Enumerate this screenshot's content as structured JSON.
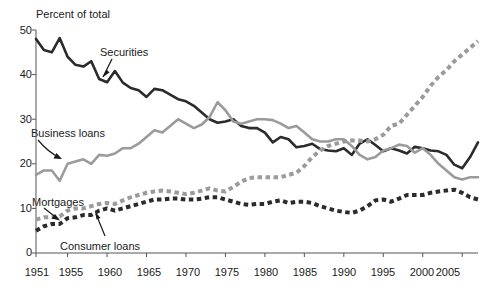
{
  "chart_data": {
    "type": "line",
    "title": "",
    "subtitle": "",
    "ylabel": "Percent of total",
    "xlabel": "",
    "ylim": [
      0,
      50
    ],
    "xlim": [
      1951,
      2007
    ],
    "grid": false,
    "legend_position": "inline-annotations",
    "y_ticks": [
      0,
      10,
      20,
      30,
      40,
      50
    ],
    "y_tick_labels": [
      "0",
      "10",
      "20",
      "30",
      "40",
      "50"
    ],
    "x_ticks": [
      1951,
      1955,
      1960,
      1965,
      1970,
      1975,
      1980,
      1985,
      1990,
      1995,
      2000,
      2005
    ],
    "x_tick_labels": [
      "1951",
      "1955",
      "1960",
      "1965",
      "1970",
      "1975",
      "1980",
      "1985",
      "1990",
      "1995",
      "2000",
      "2005"
    ],
    "x": [
      1951,
      1952,
      1953,
      1954,
      1955,
      1956,
      1957,
      1958,
      1959,
      1960,
      1961,
      1962,
      1963,
      1964,
      1965,
      1966,
      1967,
      1968,
      1969,
      1970,
      1971,
      1972,
      1973,
      1974,
      1975,
      1976,
      1977,
      1978,
      1979,
      1980,
      1981,
      1982,
      1983,
      1984,
      1985,
      1986,
      1987,
      1988,
      1989,
      1990,
      1991,
      1992,
      1993,
      1994,
      1995,
      1996,
      1997,
      1998,
      1999,
      2000,
      2001,
      2002,
      2003,
      2004,
      2005,
      2006,
      2007
    ],
    "series": [
      {
        "name": "Securities",
        "style": "solid",
        "color": "#2b2b2b",
        "values": [
          48.0,
          45.5,
          45.0,
          48.2,
          44.0,
          42.2,
          41.8,
          43.0,
          39.0,
          38.3,
          40.8,
          38.2,
          37.0,
          36.5,
          35.0,
          36.8,
          36.5,
          35.5,
          34.5,
          34.0,
          33.0,
          31.5,
          30.0,
          29.2,
          29.5,
          30.0,
          28.5,
          28.0,
          28.0,
          27.0,
          24.8,
          26.0,
          25.5,
          23.7,
          24.0,
          24.5,
          23.3,
          23.0,
          22.8,
          23.5,
          22.0,
          24.5,
          25.5,
          24.2,
          22.8,
          23.5,
          23.0,
          22.3,
          23.8,
          23.5,
          23.0,
          22.8,
          22.0,
          19.8,
          19.0,
          21.5,
          24.8
        ]
      },
      {
        "name": "Business loans",
        "style": "solid",
        "color": "#9b9b9b",
        "values": [
          17.5,
          18.5,
          18.5,
          16.2,
          20.0,
          20.5,
          21.0,
          20.0,
          22.0,
          21.8,
          22.3,
          23.5,
          23.5,
          24.5,
          26.0,
          27.5,
          27.0,
          28.5,
          30.0,
          29.0,
          28.0,
          28.8,
          30.5,
          33.8,
          32.0,
          29.5,
          29.0,
          29.5,
          30.0,
          30.0,
          29.8,
          29.0,
          28.0,
          28.5,
          27.0,
          25.5,
          25.0,
          25.0,
          25.5,
          25.5,
          24.0,
          22.0,
          21.0,
          21.5,
          23.0,
          23.5,
          24.3,
          24.0,
          22.5,
          23.5,
          22.0,
          20.0,
          18.5,
          17.0,
          16.5,
          17.0,
          17.0
        ]
      },
      {
        "name": "Mortgages",
        "style": "dashed",
        "color": "#9b9b9b",
        "values": [
          7.5,
          8.0,
          8.0,
          8.2,
          9.5,
          10.0,
          10.0,
          10.5,
          11.0,
          11.2,
          11.0,
          11.8,
          12.5,
          13.0,
          13.5,
          13.8,
          14.0,
          13.8,
          13.5,
          13.2,
          13.5,
          14.0,
          14.5,
          14.0,
          13.8,
          14.8,
          16.0,
          16.8,
          17.0,
          17.0,
          17.0,
          17.0,
          17.5,
          18.0,
          19.5,
          21.5,
          23.0,
          24.0,
          24.5,
          25.0,
          25.2,
          25.2,
          25.0,
          25.5,
          26.5,
          28.5,
          29.0,
          31.0,
          33.0,
          35.0,
          37.5,
          39.5,
          41.0,
          43.0,
          44.5,
          46.0,
          47.5
        ]
      },
      {
        "name": "Consumer loans",
        "style": "dashed",
        "color": "#2b2b2b",
        "values": [
          5.0,
          6.0,
          6.5,
          6.5,
          7.8,
          8.0,
          8.5,
          8.5,
          9.5,
          10.0,
          9.5,
          10.0,
          10.5,
          11.0,
          11.5,
          12.0,
          12.0,
          12.2,
          12.2,
          12.0,
          12.0,
          12.2,
          12.5,
          12.5,
          12.0,
          11.5,
          11.0,
          10.8,
          11.0,
          11.0,
          11.5,
          11.8,
          11.2,
          11.5,
          11.5,
          11.2,
          10.5,
          10.0,
          9.5,
          9.2,
          9.0,
          9.5,
          10.5,
          11.8,
          12.0,
          11.5,
          12.2,
          13.0,
          13.0,
          13.0,
          13.5,
          13.8,
          14.0,
          14.2,
          13.5,
          12.5,
          12.0
        ]
      }
    ],
    "annotations": [
      {
        "text": "Securities",
        "target_series": "Securities"
      },
      {
        "text": "Business loans",
        "target_series": "Business loans"
      },
      {
        "text": "Mortgages",
        "target_series": "Mortgages"
      },
      {
        "text": "Consumer loans",
        "target_series": "Consumer loans"
      }
    ]
  }
}
